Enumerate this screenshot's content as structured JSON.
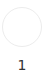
{
  "step": {
    "number": "1",
    "circle_border_color": "#ececec",
    "label_color": "#333333"
  }
}
